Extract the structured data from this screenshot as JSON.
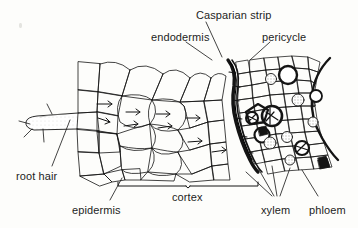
{
  "figure": {
    "title_visible": false,
    "ink_color": "#141414",
    "background_color": "#fdfdfb",
    "shade_color": "#c9c9c4"
  },
  "labels": {
    "casparian_strip": "Casparian strip",
    "endodermis": "endodermis",
    "pericycle": "pericycle",
    "root_hair": "root hair",
    "epidermis": "epidermis",
    "cortex": "cortex",
    "xylem": "xylem",
    "phloem": "phloem"
  },
  "label_positions": {
    "casparian_strip": {
      "x": 196,
      "y": 9
    },
    "endodermis": {
      "x": 151,
      "y": 31
    },
    "pericycle": {
      "x": 262,
      "y": 31
    },
    "root_hair": {
      "x": 16,
      "y": 170
    },
    "epidermis": {
      "x": 72,
      "y": 204
    },
    "cortex": {
      "x": 172,
      "y": 191
    },
    "xylem": {
      "x": 261,
      "y": 204
    },
    "phloem": {
      "x": 309,
      "y": 204
    }
  },
  "structures": [
    {
      "name": "root hair",
      "description": "elongated tubular outgrowth of an epidermal cell extending left"
    },
    {
      "name": "epidermis",
      "description": "outer single layer of small cells at the root surface"
    },
    {
      "name": "cortex",
      "description": "wide zone of large rounded parenchyma cells between epidermis and endodermis"
    },
    {
      "name": "endodermis",
      "description": "single dark cell layer bounding the vascular cylinder"
    },
    {
      "name": "Casparian strip",
      "description": "thickened dark band in the endodermal cell walls"
    },
    {
      "name": "pericycle",
      "description": "cell layer just inside the endodermis"
    },
    {
      "name": "xylem",
      "description": "thick-walled water conducting cells inside the vascular cylinder"
    },
    {
      "name": "phloem",
      "description": "shaded sugar conducting cells inside the vascular cylinder"
    }
  ],
  "annotations": {
    "arrow_count_cortex": 9,
    "arrow_meaning": "water movement through cortex toward vascular cylinder",
    "cortex_bracket": {
      "x1": 118,
      "x2": 258,
      "y": 186
    }
  }
}
